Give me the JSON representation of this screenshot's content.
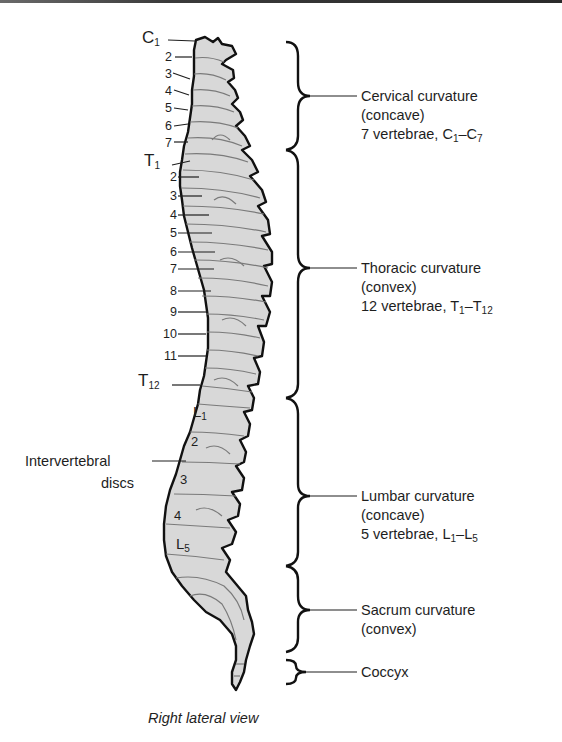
{
  "figure": {
    "caption": "Right lateral view",
    "view": "right-lateral-spine",
    "colors": {
      "bone_fill": "#d8d8d8",
      "outline": "#111111",
      "detail": "#7a7a7a",
      "text": "#1e1e1e"
    }
  },
  "cervical_labels": {
    "first": {
      "letter": "C",
      "sub": "1"
    },
    "numbers": [
      "2",
      "3",
      "4",
      "5",
      "6",
      "7"
    ]
  },
  "thoracic_labels": {
    "first": {
      "letter": "T",
      "sub": "1"
    },
    "numbers": [
      "2",
      "3",
      "4",
      "5",
      "6",
      "7",
      "8",
      "9",
      "10",
      "11"
    ],
    "last": {
      "letter": "T",
      "sub": "12"
    }
  },
  "lumbar_labels": {
    "first": {
      "letter": "L",
      "sub": "1"
    },
    "numbers": [
      "2",
      "3",
      "4"
    ],
    "last": {
      "letter": "L",
      "sub": "5"
    }
  },
  "disc_label": {
    "line1": "Intervertebral",
    "line2": "discs"
  },
  "regions": [
    {
      "name": "Cervical curvature",
      "type": "(concave)",
      "count": "7 vertebrae, ",
      "range_a": "C",
      "range_a_sub": "1",
      "dash": "–",
      "range_b": "C",
      "range_b_sub": "7"
    },
    {
      "name": "Thoracic curvature",
      "type": "(convex)",
      "count": "12 vertebrae, ",
      "range_a": "T",
      "range_a_sub": "1",
      "dash": "–",
      "range_b": "T",
      "range_b_sub": "12"
    },
    {
      "name": "Lumbar curvature",
      "type": "(concave)",
      "count": "5 vertebrae, ",
      "range_a": "L",
      "range_a_sub": "1",
      "dash": "–",
      "range_b": "L",
      "range_b_sub": "5"
    },
    {
      "name": "Sacrum curvature",
      "type": "(convex)"
    },
    {
      "name": "Coccyx"
    }
  ]
}
